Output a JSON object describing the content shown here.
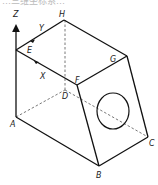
{
  "header": {
    "partial_text": "…三维坐标系…"
  },
  "diagram": {
    "type": "isometric-solid",
    "axes": {
      "z_label": "Z",
      "y_label": "Y",
      "x_label": "X"
    },
    "vertices": {
      "A": "A",
      "B": "B",
      "C": "C",
      "D": "D",
      "E": "E",
      "F": "F",
      "G": "G",
      "H": "H"
    },
    "feature": "circular-hole-on-face-BCGF",
    "colors": {
      "line": "#111111",
      "hidden_line": "#555555",
      "background": "#ffffff"
    }
  }
}
